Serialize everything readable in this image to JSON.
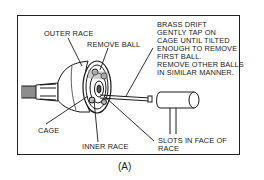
{
  "figure": {
    "caption": "(A)",
    "labels": {
      "outer_race": "OUTER RACE",
      "remove_ball": "REMOVE BALL",
      "cage": "CAGE",
      "inner_race": "INNER RACE",
      "slots": "SLOTS IN FACE OF\nRACE",
      "brass_drift_note": "BRASS DRIFT\nGENTLY TAP ON\nCAGE UNTIL TILTED\nENOUGH TO REMOVE\nFIRST BALL.\nREMOVE OTHER BALLS\nIN SIMILAR MANNER."
    }
  }
}
